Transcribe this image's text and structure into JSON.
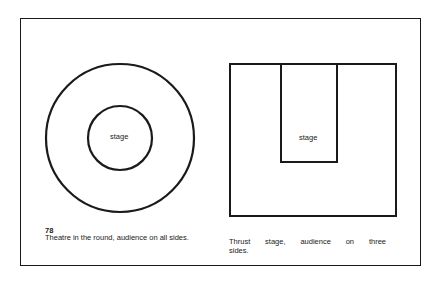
{
  "figure": {
    "number": "78"
  },
  "left_diagram": {
    "type": "theatre-in-the-round",
    "stage_label": "stage",
    "caption": "Theatre in the round, audience on all sides.",
    "outer_circle": {
      "cx": 120,
      "cy": 138,
      "r": 74
    },
    "inner_circle": {
      "cx": 120,
      "cy": 138,
      "r": 32
    }
  },
  "right_diagram": {
    "type": "thrust-stage",
    "stage_label": "stage",
    "caption_words": [
      "Thrust",
      "stage,",
      "audience",
      "on",
      "three"
    ],
    "caption_line2": "sides.",
    "caption": "Thrust stage, audience on three sides.",
    "outer_rect": {
      "x": 230,
      "y": 64,
      "w": 166,
      "h": 152
    },
    "stage_rect": {
      "x": 281,
      "y": 64,
      "w": 56,
      "h": 98
    }
  },
  "colors": {
    "line": "#1a1a1a",
    "background": "#ffffff"
  }
}
